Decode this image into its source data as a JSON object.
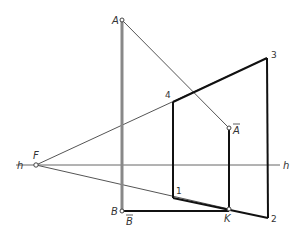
{
  "diagram": {
    "type": "perspective-construction",
    "colors": {
      "thin_line": "#555555",
      "thick_line": "#111111",
      "post_line": "#888888",
      "label": "#333333",
      "background": "#ffffff"
    },
    "points": {
      "A": {
        "label": "A",
        "x": 122,
        "y": 20
      },
      "B": {
        "label": "B",
        "x": 122,
        "y": 211
      },
      "F": {
        "label": "F",
        "x": 36,
        "y": 165
      },
      "Abar": {
        "label": "A",
        "overline": true,
        "x": 229,
        "y": 128
      },
      "Bbar": {
        "label": "B",
        "overline": true,
        "x": 122,
        "y": 211
      },
      "K": {
        "label": "K",
        "x": 229,
        "y": 209
      },
      "p1": {
        "label": "1",
        "x": 173,
        "y": 198
      },
      "p2": {
        "label": "2",
        "x": 268,
        "y": 218
      },
      "p3": {
        "label": "3",
        "x": 267,
        "y": 58
      },
      "p4": {
        "label": "4",
        "x": 173,
        "y": 102
      }
    },
    "horizon": {
      "label_left": "h",
      "label_right": "h",
      "y": 165,
      "x_start": 16,
      "x_end": 280
    },
    "labels": {
      "A": "A",
      "B": "B",
      "F": "F",
      "Abar": "A",
      "Bbar": "B",
      "K": "K",
      "h_left": "h",
      "h_right": "h",
      "n1": "1",
      "n2": "2",
      "n3": "3",
      "n4": "4"
    }
  }
}
